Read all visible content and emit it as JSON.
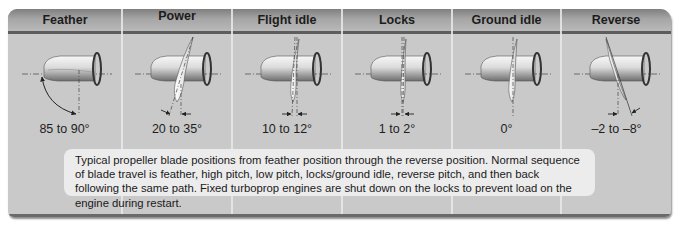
{
  "figure": {
    "columns": [
      {
        "title": "Feather",
        "angle": "85 to 90°",
        "blade_angle_deg": 88
      },
      {
        "title": "Power",
        "angle": "20 to 35°",
        "blade_angle_deg": 28
      },
      {
        "title": "Flight idle",
        "angle": "10 to 12°",
        "blade_angle_deg": 11
      },
      {
        "title": "Locks",
        "angle": "1 to 2°",
        "blade_angle_deg": 2
      },
      {
        "title": "Ground idle",
        "angle": "0°",
        "blade_angle_deg": 0
      },
      {
        "title": "Reverse",
        "angle": "–2 to –8°",
        "blade_angle_deg": -6
      }
    ],
    "caption": "Typical propeller blade positions from feather position through the reverse position. Normal sequence of blade travel is feather, high pitch, low pitch, locks/ground idle, reverse pitch, and then back following the same path. Fixed turboprop engines are shut down on the locks to prevent load on the engine during restart.",
    "colors": {
      "frame": "#c9c9c9",
      "header_dark": "#7f7f7f",
      "header_light": "#b9b9b9",
      "caption_bg": "#ececec",
      "text": "#1c1c1c"
    }
  }
}
